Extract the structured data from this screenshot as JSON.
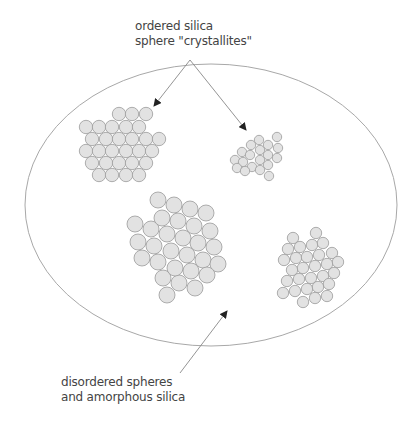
{
  "labels": {
    "top_line1": "ordered silica",
    "top_line2": "sphere \"crystallites\"",
    "bottom_line1": "disordered spheres",
    "bottom_line2": "and amorphous silica"
  },
  "colors": {
    "sphere_fill": "#e2e2e2",
    "sphere_stroke": "#9a9a9a",
    "ellipse_stroke": "#a8a8a8",
    "arrow": "#888888",
    "text": "#444444"
  },
  "ellipse": {
    "cx": 211,
    "cy": 205,
    "rx": 186,
    "ry": 141
  },
  "arrows": [
    {
      "x1": 190,
      "y1": 60,
      "x2": 154,
      "y2": 106
    },
    {
      "x1": 190,
      "y1": 60,
      "x2": 246,
      "y2": 130
    },
    {
      "x1": 180,
      "y1": 373,
      "x2": 227,
      "y2": 311
    }
  ],
  "clusters": [
    {
      "name": "crystallite-top-left",
      "r": 6.7,
      "spheres": [
        [
          119,
          114
        ],
        [
          132,
          114
        ],
        [
          146,
          114
        ],
        [
          86,
          127
        ],
        [
          99,
          127
        ],
        [
          112,
          127
        ],
        [
          126,
          127
        ],
        [
          139,
          127
        ],
        [
          92,
          139
        ],
        [
          106,
          139
        ],
        [
          119,
          139
        ],
        [
          132,
          139
        ],
        [
          146,
          139
        ],
        [
          159,
          139
        ],
        [
          86,
          151
        ],
        [
          99,
          151
        ],
        [
          112,
          151
        ],
        [
          126,
          151
        ],
        [
          139,
          151
        ],
        [
          152,
          151
        ],
        [
          92,
          163
        ],
        [
          106,
          163
        ],
        [
          119,
          163
        ],
        [
          132,
          163
        ],
        [
          146,
          163
        ],
        [
          99,
          175
        ],
        [
          112,
          175
        ],
        [
          126,
          175
        ],
        [
          139,
          175
        ]
      ]
    },
    {
      "name": "crystallite-top-right",
      "r": 4.7,
      "spheres": [
        [
          277,
          137
        ],
        [
          259,
          140
        ],
        [
          268,
          145
        ],
        [
          278,
          148
        ],
        [
          251,
          145
        ],
        [
          260,
          150
        ],
        [
          242,
          152
        ],
        [
          250,
          155
        ],
        [
          268,
          155
        ],
        [
          277,
          158
        ],
        [
          235,
          160
        ],
        [
          243,
          162
        ],
        [
          260,
          160
        ],
        [
          268,
          165
        ],
        [
          252,
          167
        ],
        [
          260,
          170
        ],
        [
          237,
          168
        ],
        [
          245,
          171
        ],
        [
          269,
          176
        ]
      ]
    },
    {
      "name": "crystallite-bottom-center",
      "r": 8,
      "spheres": [
        [
          158,
          200
        ],
        [
          174,
          205
        ],
        [
          190,
          209
        ],
        [
          206,
          213
        ],
        [
          135,
          224
        ],
        [
          151,
          229
        ],
        [
          162,
          218
        ],
        [
          178,
          221
        ],
        [
          194,
          226
        ],
        [
          210,
          231
        ],
        [
          138,
          242
        ],
        [
          154,
          246
        ],
        [
          167,
          234
        ],
        [
          183,
          238
        ],
        [
          198,
          243
        ],
        [
          214,
          247
        ],
        [
          142,
          258
        ],
        [
          158,
          262
        ],
        [
          171,
          251
        ],
        [
          187,
          255
        ],
        [
          203,
          260
        ],
        [
          218,
          264
        ],
        [
          163,
          278
        ],
        [
          179,
          283
        ],
        [
          175,
          268
        ],
        [
          191,
          271
        ],
        [
          207,
          275
        ],
        [
          195,
          288
        ],
        [
          167,
          295
        ]
      ]
    },
    {
      "name": "crystallite-bottom-right",
      "r": 5.7,
      "spheres": [
        [
          293,
          238
        ],
        [
          316,
          233
        ],
        [
          288,
          249
        ],
        [
          300,
          247
        ],
        [
          312,
          245
        ],
        [
          323,
          243
        ],
        [
          284,
          260
        ],
        [
          296,
          258
        ],
        [
          307,
          257
        ],
        [
          319,
          255
        ],
        [
          332,
          253
        ],
        [
          292,
          270
        ],
        [
          303,
          268
        ],
        [
          315,
          266
        ],
        [
          327,
          264
        ],
        [
          338,
          262
        ],
        [
          287,
          281
        ],
        [
          299,
          279
        ],
        [
          311,
          278
        ],
        [
          323,
          276
        ],
        [
          334,
          273
        ],
        [
          283,
          293
        ],
        [
          295,
          291
        ],
        [
          307,
          289
        ],
        [
          318,
          287
        ],
        [
          329,
          284
        ],
        [
          303,
          302
        ],
        [
          315,
          298
        ],
        [
          327,
          296
        ]
      ]
    }
  ]
}
